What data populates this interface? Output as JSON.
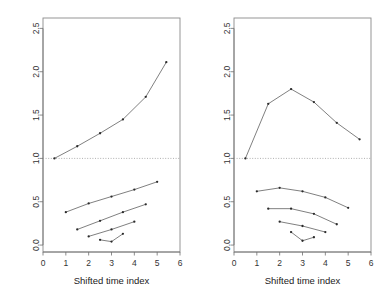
{
  "figure": {
    "width": 382,
    "height": 297,
    "background": "#ffffff",
    "line_color": "#555555",
    "point_color": "#2b2b2b",
    "axis_color": "#6e6e6e",
    "frame_color": "#8a8a8a",
    "reference_line_color": "#9a9a9a"
  },
  "chart_data": [
    {
      "type": "line",
      "panel": "left",
      "title": "",
      "xlabel": "Shifted time index",
      "ylabel": "",
      "xlim": [
        0,
        6
      ],
      "ylim": [
        -0.08,
        2.62
      ],
      "xticks": [
        0,
        1,
        2,
        3,
        4,
        5,
        6
      ],
      "xticklabels": [
        "0",
        "1",
        "2",
        "3",
        "4",
        "5",
        "6"
      ],
      "yticks": [
        0.0,
        0.5,
        1.0,
        1.5,
        2.0,
        2.5
      ],
      "yticklabels": [
        "0.0",
        "0.5",
        "1.0",
        "1.5",
        "2.0",
        "2.5"
      ],
      "grid": false,
      "legend": "none",
      "annotations": [
        {
          "kind": "reference-line",
          "orientation": "horizontal",
          "y": 1.0,
          "style": "dotted"
        }
      ],
      "series": [
        {
          "name": "upper-curve",
          "marker": "point",
          "x": [
            0.5,
            1.5,
            2.5,
            3.5,
            4.5,
            5.4
          ],
          "y": [
            1.0,
            1.14,
            1.29,
            1.45,
            1.71,
            2.11
          ]
        },
        {
          "name": "lower-segment-1",
          "marker": "point",
          "x": [
            1.0,
            2.0,
            3.0,
            4.0,
            5.0
          ],
          "y": [
            0.38,
            0.48,
            0.56,
            0.64,
            0.73
          ]
        },
        {
          "name": "lower-segment-2",
          "marker": "point",
          "x": [
            1.5,
            2.5,
            3.5,
            4.5
          ],
          "y": [
            0.18,
            0.28,
            0.38,
            0.47
          ]
        },
        {
          "name": "lower-segment-3",
          "marker": "point",
          "x": [
            2.0,
            3.0,
            4.0
          ],
          "y": [
            0.1,
            0.18,
            0.27
          ]
        },
        {
          "name": "lower-segment-4",
          "marker": "point",
          "x": [
            2.5,
            3.0,
            3.5
          ],
          "y": [
            0.06,
            0.04,
            0.13
          ]
        }
      ]
    },
    {
      "type": "line",
      "panel": "right",
      "title": "",
      "xlabel": "Shifted time index",
      "ylabel": "",
      "xlim": [
        0,
        6
      ],
      "ylim": [
        -0.08,
        2.62
      ],
      "xticks": [
        0,
        1,
        2,
        3,
        4,
        5,
        6
      ],
      "xticklabels": [
        "0",
        "1",
        "2",
        "3",
        "4",
        "5",
        "6"
      ],
      "yticks": [
        0.0,
        0.5,
        1.0,
        1.5,
        2.0,
        2.5
      ],
      "yticklabels": [
        "0.0",
        "0.5",
        "1.0",
        "1.5",
        "2.0",
        "2.5"
      ],
      "grid": false,
      "legend": "none",
      "annotations": [
        {
          "kind": "reference-line",
          "orientation": "horizontal",
          "y": 1.0,
          "style": "dotted"
        }
      ],
      "series": [
        {
          "name": "upper-curve",
          "marker": "point",
          "x": [
            0.5,
            1.5,
            2.5,
            3.5,
            4.5,
            5.5
          ],
          "y": [
            1.0,
            1.63,
            1.8,
            1.65,
            1.41,
            1.22
          ]
        },
        {
          "name": "lower-segment-1",
          "marker": "point",
          "x": [
            1.0,
            2.0,
            3.0,
            4.0,
            5.0
          ],
          "y": [
            0.62,
            0.66,
            0.62,
            0.55,
            0.43
          ]
        },
        {
          "name": "lower-segment-2",
          "marker": "point",
          "x": [
            1.5,
            2.5,
            3.5,
            4.5
          ],
          "y": [
            0.42,
            0.42,
            0.36,
            0.24
          ]
        },
        {
          "name": "lower-segment-3",
          "marker": "point",
          "x": [
            2.0,
            3.0,
            4.0
          ],
          "y": [
            0.27,
            0.22,
            0.15
          ]
        },
        {
          "name": "lower-segment-4",
          "marker": "point",
          "x": [
            2.5,
            3.0,
            3.5
          ],
          "y": [
            0.15,
            0.05,
            0.09
          ]
        }
      ]
    }
  ]
}
